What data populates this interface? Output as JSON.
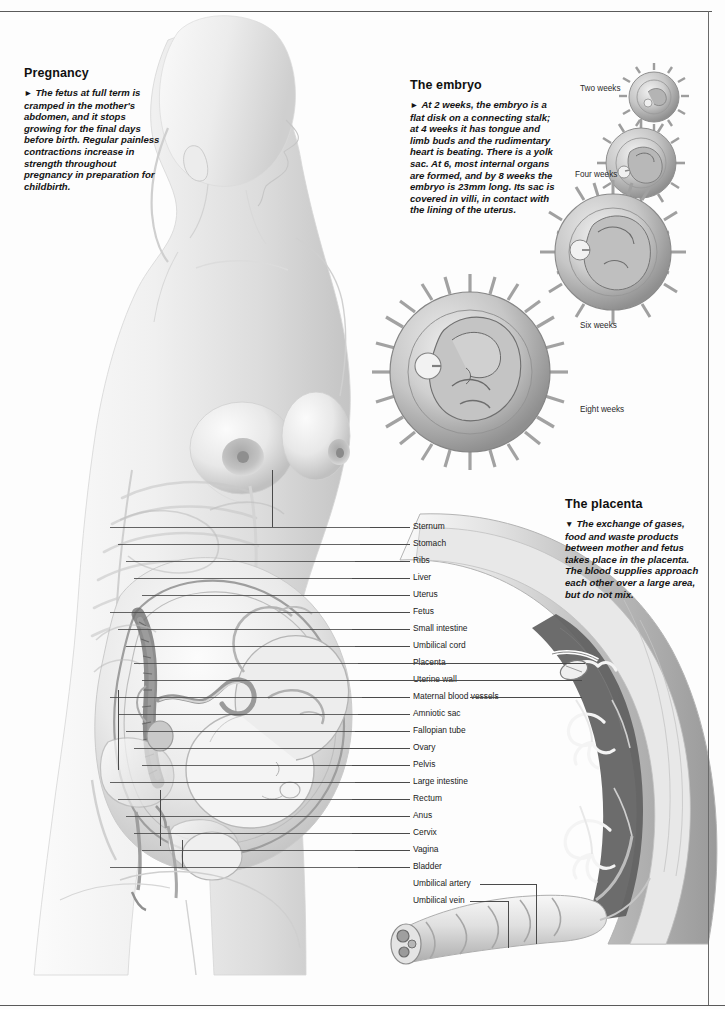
{
  "page": {
    "folio": "",
    "background": "#fdfdfd",
    "rule_color": "#5a5a5a"
  },
  "blocks": {
    "pregnancy": {
      "heading": "Pregnancy",
      "bullet": "►",
      "body": "The fetus at full term is cramped in the mother's abdomen, and it stops growing for the final days before birth. Regular painless contractions increase in strength throughout pregnancy in preparation for childbirth."
    },
    "embryo": {
      "heading": "The embryo",
      "bullet": "►",
      "body": "At 2 weeks, the embryo is a flat disk on a connecting stalk; at 4 weeks it has tongue and limb buds and the rudimentary heart is beating. There is a yolk sac. At 6, most internal organs are formed, and by 8 weeks the embryo is 23mm long. Its sac is covered in villi, in contact with the lining of the uterus."
    },
    "placenta": {
      "heading": "The placenta",
      "bullet": "▼",
      "body": "The exchange of gases, food and waste products between mother and fetus takes place in the placenta. The blood supplies approach each other over a large area, but do not mix."
    }
  },
  "embryo_stages": [
    {
      "label": "Two weeks",
      "cx": 654,
      "cy": 97,
      "r": 25,
      "cap_x": 580,
      "cap_y": 84
    },
    {
      "label": "Four weeks",
      "cx": 641,
      "cy": 163,
      "r": 35,
      "cap_x": 575,
      "cap_y": 170
    },
    {
      "label": "Six weeks",
      "cx": 613,
      "cy": 252,
      "r": 58,
      "cap_x": 580,
      "cap_y": 321
    },
    {
      "label": "Eight weeks",
      "cx": 470,
      "cy": 372,
      "r": 80,
      "cap_x": 580,
      "cap_y": 405
    }
  ],
  "anatomy_labels": [
    {
      "text": "Sternum",
      "y": 527,
      "leader_x": 370,
      "leader_w": 40
    },
    {
      "text": "Stomach",
      "y": 544,
      "leader_x": 360,
      "leader_w": 50
    },
    {
      "text": "Ribs",
      "y": 561,
      "leader_x": 355,
      "leader_w": 55
    },
    {
      "text": "Liver",
      "y": 578,
      "leader_x": 352,
      "leader_w": 58
    },
    {
      "text": "Uterus",
      "y": 595,
      "leader_x": 350,
      "leader_w": 60
    },
    {
      "text": "Fetus",
      "y": 612,
      "leader_x": 350,
      "leader_w": 60
    },
    {
      "text": "Small intestine",
      "y": 629,
      "leader_x": 352,
      "leader_w": 58
    },
    {
      "text": "Umbilical cord",
      "y": 646,
      "leader_x": 355,
      "leader_w": 55
    },
    {
      "text": "Placenta",
      "y": 663,
      "leader_x": 358,
      "leader_w": 52
    },
    {
      "text": "Uterine wall",
      "y": 680,
      "leader_x": 360,
      "leader_w": 50
    },
    {
      "text": "Maternal blood vessels",
      "y": 697,
      "leader_x": 362,
      "leader_w": 48
    },
    {
      "text": "Amniotic sac",
      "y": 714,
      "leader_x": 358,
      "leader_w": 52
    },
    {
      "text": "Fallopian tube",
      "y": 731,
      "leader_x": 355,
      "leader_w": 55
    },
    {
      "text": "Ovary",
      "y": 748,
      "leader_x": 350,
      "leader_w": 60
    },
    {
      "text": "Pelvis",
      "y": 765,
      "leader_x": 352,
      "leader_w": 58
    },
    {
      "text": "Large intestine",
      "y": 782,
      "leader_x": 355,
      "leader_w": 55
    },
    {
      "text": "Rectum",
      "y": 799,
      "leader_x": 352,
      "leader_w": 58
    },
    {
      "text": "Anus",
      "y": 816,
      "leader_x": 350,
      "leader_w": 60
    },
    {
      "text": "Cervix",
      "y": 833,
      "leader_x": 352,
      "leader_w": 58
    },
    {
      "text": "Vagina",
      "y": 850,
      "leader_x": 355,
      "leader_w": 55
    },
    {
      "text": "Bladder",
      "y": 867,
      "leader_x": 358,
      "leader_w": 52
    },
    {
      "text": "Umbilical artery",
      "y": 884,
      "leader_x": 0,
      "leader_w": 0
    },
    {
      "text": "Umbilical vein",
      "y": 901,
      "leader_x": 0,
      "leader_w": 0
    }
  ],
  "illustration": {
    "figure_name": "pregnant-female-sagittal-section",
    "placenta_name": "placenta-cross-section",
    "cord_name": "umbilical-cord-detail",
    "tone_light": "#f2f2f2",
    "tone_mid": "#c9c9c9",
    "tone_dark": "#8d8d8d",
    "tone_deep": "#5b5b5b"
  }
}
